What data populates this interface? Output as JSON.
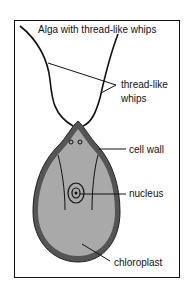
{
  "title": "Alga with thread-like whips",
  "labels": {
    "whips_line1": "thread-like",
    "whips_line2": "whips",
    "cell_wall": "cell wall",
    "nucleus": "nucleus",
    "chloroplast": "chloroplast"
  },
  "colors": {
    "cell_fill": "#a9a9a9",
    "cell_wall": "#555555",
    "line": "#111111"
  }
}
